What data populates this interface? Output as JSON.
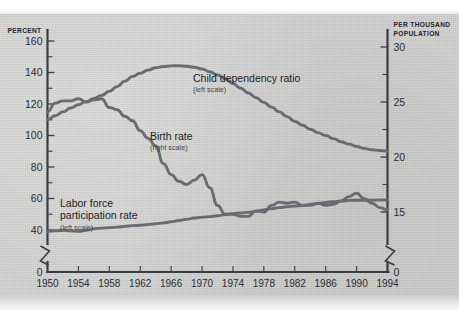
{
  "chart_data": {
    "type": "line",
    "title": "",
    "xlabel": "",
    "ylabel": "Percent",
    "ylabel_right": "Per thousand population",
    "grid": false,
    "legend_position": "inline-annotations",
    "x": [
      1950,
      1951,
      1952,
      1953,
      1954,
      1955,
      1956,
      1957,
      1958,
      1959,
      1960,
      1961,
      1962,
      1963,
      1964,
      1965,
      1966,
      1967,
      1968,
      1969,
      1970,
      1971,
      1972,
      1973,
      1974,
      1975,
      1976,
      1977,
      1978,
      1979,
      1980,
      1981,
      1982,
      1983,
      1984,
      1985,
      1986,
      1987,
      1988,
      1989,
      1990,
      1991,
      1992,
      1993,
      1994
    ],
    "xlim": [
      1950,
      1994
    ],
    "xticks": [
      1950,
      1954,
      1958,
      1962,
      1966,
      1970,
      1974,
      1978,
      1982,
      1986,
      1990,
      1994
    ],
    "left_axis": {
      "label": "PERCENT",
      "ticks_major": [
        0,
        40,
        60,
        80,
        100,
        120,
        140,
        160
      ],
      "ticks_minor": [
        50,
        70,
        90,
        110,
        130,
        150
      ],
      "ylim": [
        0,
        170
      ],
      "axis_break": true
    },
    "right_axis": {
      "label_line1": "PER THOUSAND",
      "label_line2": "POPULATION",
      "ticks_major": [
        0,
        15,
        20,
        25,
        30
      ],
      "ticks_minor": [
        17.5,
        22.5,
        27.5
      ],
      "ylim": [
        0,
        31.5
      ],
      "axis_break": true
    },
    "series": [
      {
        "name": "Child dependency ratio",
        "scale": "left",
        "scale_note": "(left scale)",
        "color": "#6a6a72",
        "values": [
          110.0,
          112.5,
          115.0,
          117.5,
          119.5,
          121.5,
          123.5,
          125.5,
          128.0,
          131.0,
          134.5,
          137.5,
          139.5,
          141.5,
          143.0,
          143.8,
          144.2,
          144.3,
          144.0,
          143.3,
          142.2,
          140.5,
          138.5,
          136.0,
          133.0,
          130.0,
          127.0,
          124.0,
          121.0,
          118.0,
          115.0,
          112.0,
          109.0,
          106.5,
          104.0,
          101.8,
          100.0,
          98.0,
          96.0,
          94.5,
          93.0,
          91.8,
          91.0,
          90.5,
          90.2
        ]
      },
      {
        "name": "Birth rate",
        "scale": "right",
        "scale_note": "(right scale)",
        "color": "#6a6a72",
        "values": [
          24.1,
          24.9,
          25.1,
          25.1,
          25.3,
          25.0,
          25.2,
          25.3,
          24.5,
          24.3,
          23.7,
          23.3,
          22.4,
          21.7,
          21.0,
          19.4,
          18.4,
          17.8,
          17.5,
          17.9,
          18.4,
          17.2,
          15.6,
          14.8,
          14.8,
          14.6,
          14.6,
          15.1,
          15.0,
          15.6,
          15.9,
          15.8,
          15.9,
          15.6,
          15.6,
          15.8,
          15.6,
          15.7,
          16.0,
          16.4,
          16.7,
          16.2,
          15.8,
          15.4,
          15.2
        ]
      },
      {
        "name": "Labor force participation rate",
        "scale": "left",
        "scale_note": "(left scale)",
        "color": "#6a6a72",
        "values": [
          39.0,
          39.5,
          39.8,
          39.5,
          39.2,
          39.8,
          40.8,
          41.2,
          41.5,
          41.8,
          42.3,
          42.8,
          43.0,
          43.5,
          44.0,
          44.5,
          45.2,
          46.0,
          46.8,
          47.6,
          48.2,
          48.5,
          49.0,
          49.8,
          50.4,
          50.8,
          51.2,
          51.9,
          52.8,
          53.6,
          54.2,
          54.8,
          55.2,
          55.6,
          56.2,
          56.8,
          57.5,
          58.0,
          58.4,
          58.8,
          58.9,
          58.9,
          58.9,
          59.0,
          59.0
        ]
      }
    ]
  },
  "annotations": [
    {
      "id": "child-dependency",
      "label": "Child dependency ratio",
      "sub": "(left scale)"
    },
    {
      "id": "birth-rate",
      "label": "Birth rate",
      "sub": "(right scale)"
    },
    {
      "id": "labor-force",
      "label": "Labor force",
      "label2": "participation rate",
      "sub": "(left scale)"
    }
  ],
  "axis_labels": {
    "left": "PERCENT",
    "right_line1": "PER THOUSAND",
    "right_line2": "POPULATION"
  }
}
